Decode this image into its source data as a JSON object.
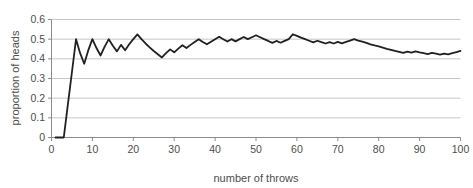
{
  "chart_data": {
    "type": "line",
    "title": "",
    "xlabel": "number of throws",
    "ylabel": "proportion of heads",
    "xlim": [
      0,
      100
    ],
    "ylim": [
      0,
      0.6
    ],
    "xticks": [
      0,
      10,
      20,
      30,
      40,
      50,
      60,
      70,
      80,
      90,
      100
    ],
    "xtick_labels": [
      "0",
      "10",
      "20",
      "30",
      "40",
      "50",
      "60",
      "70",
      "80",
      "90",
      "100"
    ],
    "yticks": [
      0,
      0.1,
      0.2,
      0.3,
      0.4,
      0.5,
      0.6
    ],
    "ytick_labels": [
      "0",
      "0.1",
      "0.2",
      "0.3",
      "0.4",
      "0.5",
      "0.6"
    ],
    "grid": "horizontal",
    "legend": "none",
    "line_color": "#231f20",
    "grid_color": "#c6c6c6",
    "axis_color": "#8c8c8c",
    "series": [
      {
        "name": "proportion of heads",
        "x": [
          1,
          2,
          3,
          4,
          5,
          6,
          7,
          8,
          9,
          10,
          11,
          12,
          13,
          14,
          15,
          16,
          17,
          18,
          19,
          20,
          21,
          22,
          23,
          24,
          25,
          26,
          27,
          28,
          29,
          30,
          31,
          32,
          33,
          34,
          35,
          36,
          37,
          38,
          39,
          40,
          41,
          42,
          43,
          44,
          45,
          46,
          47,
          48,
          49,
          50,
          51,
          52,
          53,
          54,
          55,
          56,
          57,
          58,
          59,
          60,
          61,
          62,
          63,
          64,
          65,
          66,
          67,
          68,
          69,
          70,
          71,
          72,
          73,
          74,
          75,
          76,
          77,
          78,
          79,
          80,
          81,
          82,
          83,
          84,
          85,
          86,
          87,
          88,
          89,
          90,
          91,
          92,
          93,
          94,
          95,
          96,
          97,
          98,
          99,
          100
        ],
        "values": [
          0,
          0,
          0,
          0.167,
          0.333,
          0.5,
          0.429,
          0.375,
          0.444,
          0.5,
          0.455,
          0.417,
          0.462,
          0.5,
          0.467,
          0.438,
          0.471,
          0.444,
          0.474,
          0.5,
          0.524,
          0.5,
          0.478,
          0.458,
          0.44,
          0.423,
          0.407,
          0.429,
          0.448,
          0.433,
          0.452,
          0.469,
          0.455,
          0.471,
          0.486,
          0.5,
          0.486,
          0.474,
          0.487,
          0.5,
          0.512,
          0.5,
          0.488,
          0.5,
          0.489,
          0.5,
          0.511,
          0.5,
          0.51,
          0.52,
          0.51,
          0.5,
          0.491,
          0.481,
          0.491,
          0.482,
          0.491,
          0.5,
          0.525,
          0.517,
          0.508,
          0.5,
          0.492,
          0.484,
          0.492,
          0.485,
          0.478,
          0.485,
          0.478,
          0.486,
          0.479,
          0.486,
          0.493,
          0.5,
          0.493,
          0.487,
          0.481,
          0.474,
          0.468,
          0.463,
          0.457,
          0.451,
          0.446,
          0.44,
          0.435,
          0.43,
          0.437,
          0.432,
          0.438,
          0.433,
          0.429,
          0.424,
          0.43,
          0.426,
          0.421,
          0.427,
          0.423,
          0.429,
          0.434,
          0.44
        ]
      }
    ]
  }
}
